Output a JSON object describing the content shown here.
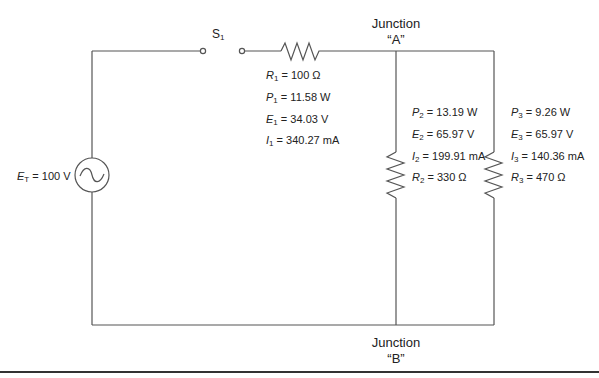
{
  "switch": {
    "label": "S",
    "sub": "1"
  },
  "source": {
    "label": "E",
    "sub": "T",
    "value": "= 100 V"
  },
  "junctions": {
    "A": {
      "line1": "Junction",
      "line2": "“A”"
    },
    "B": {
      "line1": "Junction",
      "line2": "“B”"
    }
  },
  "r1": [
    {
      "sym": "R",
      "sub": "1",
      "value": "= 100 Ω"
    },
    {
      "sym": "P",
      "sub": "1",
      "value": "= 11.58 W"
    },
    {
      "sym": "E",
      "sub": "1",
      "value": "= 34.03 V"
    },
    {
      "sym": "I",
      "sub": "1",
      "value": "= 340.27 mA"
    }
  ],
  "r2": [
    {
      "sym": "P",
      "sub": "2",
      "value": "= 13.19 W"
    },
    {
      "sym": "E",
      "sub": "2",
      "value": "= 65.97 V"
    },
    {
      "sym": "I",
      "sub": "2",
      "value": "= 199.91 mA"
    },
    {
      "sym": "R",
      "sub": "2",
      "value": "= 330 Ω"
    }
  ],
  "r3": [
    {
      "sym": "P",
      "sub": "3",
      "value": "= 9.26 W"
    },
    {
      "sym": "E",
      "sub": "3",
      "value": "= 65.97 V"
    },
    {
      "sym": "I",
      "sub": "3",
      "value": "= 140.36 mA"
    },
    {
      "sym": "R",
      "sub": "3",
      "value": "= 470 Ω"
    }
  ],
  "colors": {
    "wire": "#555555",
    "text": "#222222"
  }
}
